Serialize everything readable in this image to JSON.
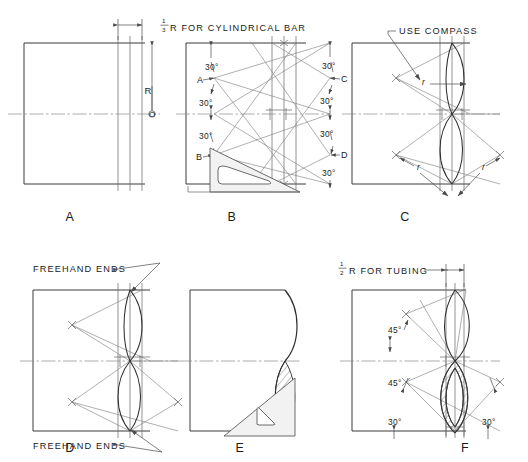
{
  "figure": {
    "background_color": "#ffffff",
    "line_color": "#3b3b3b",
    "construction_color": "#7a7a7a",
    "caption": ""
  },
  "panels": [
    {
      "id": "A",
      "letter": "A",
      "notes": [
        {
          "name": "third-r-note",
          "text": "R FOR CYLINDRICAL BAR",
          "fraction_numerator": "1",
          "fraction_denominator": "3"
        }
      ],
      "labels": [
        {
          "name": "radius-dimension-label",
          "text": "R"
        },
        {
          "name": "center-point-label",
          "text": "O"
        }
      ]
    },
    {
      "id": "B",
      "letter": "B",
      "labels": [
        {
          "name": "point-a-label",
          "text": "A"
        },
        {
          "name": "point-b-label",
          "text": "B"
        },
        {
          "name": "point-c-label",
          "text": "C"
        },
        {
          "name": "point-d-label",
          "text": "D"
        }
      ],
      "angles_left": [
        "30°",
        "30°",
        "30°"
      ],
      "angles_right": [
        "30°",
        "30°",
        "30°",
        "30°"
      ]
    },
    {
      "id": "C",
      "letter": "C",
      "notes": [
        {
          "name": "use-compass-note",
          "text": "USE COMPASS"
        }
      ],
      "radius_labels": [
        "r",
        "r",
        "r"
      ]
    },
    {
      "id": "D",
      "letter": "D",
      "notes": [
        {
          "name": "freehand-ends-note-top",
          "text": "FREEHAND ENDS"
        },
        {
          "name": "freehand-ends-note-bottom",
          "text": "FREEHAND ENDS"
        }
      ]
    },
    {
      "id": "E",
      "letter": "E",
      "notes": []
    },
    {
      "id": "F",
      "letter": "F",
      "notes": [
        {
          "name": "half-r-note",
          "text": "R FOR TUBING",
          "fraction_numerator": "1",
          "fraction_denominator": "2"
        }
      ],
      "angles_left": [
        "45°",
        "45°",
        "30°"
      ],
      "angles_right": [
        "30°"
      ]
    }
  ],
  "panel_letters": {
    "a": "A",
    "b": "B",
    "c": "C",
    "d": "D",
    "e": "E",
    "f": "F"
  },
  "text": {
    "cyl_note_main": "R FOR CYLINDRICAL BAR",
    "cyl_note_num": "1",
    "cyl_note_den": "3",
    "tubing_note_main": "R FOR TUBING",
    "tubing_note_num": "1",
    "tubing_note_den": "2",
    "use_compass": "USE COMPASS",
    "freehand_top": "FREEHAND ENDS",
    "freehand_bottom": "FREEHAND ENDS",
    "r_dim": "R",
    "o_center": "O",
    "pt_a": "A",
    "pt_b": "B",
    "pt_c": "C",
    "pt_d": "D",
    "deg30": "30°",
    "deg45": "45°",
    "rad_r": "r"
  }
}
